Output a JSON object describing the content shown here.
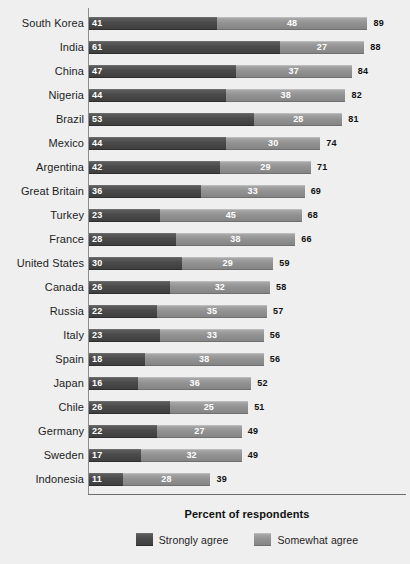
{
  "chart_data": {
    "type": "bar",
    "orientation": "horizontal",
    "stacked": true,
    "title": "",
    "xlabel": "Percent of respondents",
    "ylabel": "",
    "xlim": [
      0,
      100
    ],
    "grid": false,
    "legend_position": "bottom",
    "categories": [
      "South Korea",
      "India",
      "China",
      "Nigeria",
      "Brazil",
      "Mexico",
      "Argentina",
      "Great Britain",
      "Turkey",
      "France",
      "United States",
      "Canada",
      "Russia",
      "Italy",
      "Spain",
      "Japan",
      "Chile",
      "Germany",
      "Sweden",
      "Indonesia"
    ],
    "series": [
      {
        "name": "Strongly agree",
        "color": "#4a4a4a",
        "values": [
          41,
          61,
          47,
          44,
          53,
          44,
          42,
          36,
          23,
          28,
          30,
          26,
          22,
          23,
          18,
          16,
          26,
          22,
          17,
          11
        ]
      },
      {
        "name": "Somewhat agree",
        "color": "#939393",
        "values": [
          48,
          27,
          37,
          38,
          28,
          30,
          29,
          33,
          45,
          38,
          29,
          32,
          35,
          33,
          38,
          36,
          25,
          27,
          32,
          28
        ]
      }
    ],
    "totals": [
      89,
      88,
      84,
      82,
      81,
      74,
      71,
      69,
      68,
      66,
      59,
      58,
      57,
      56,
      56,
      52,
      51,
      49,
      49,
      39
    ]
  },
  "legend": {
    "items": [
      {
        "label": "Strongly agree",
        "swatch": "strong"
      },
      {
        "label": "Somewhat agree",
        "swatch": "somewhat"
      }
    ]
  },
  "axis": {
    "x_title": "Percent of respondents"
  }
}
